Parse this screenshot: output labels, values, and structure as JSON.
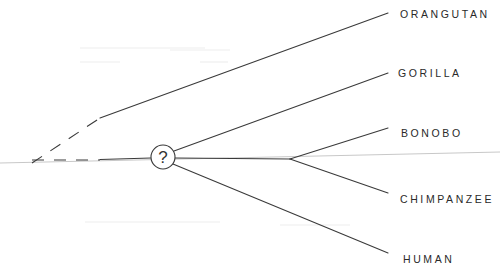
{
  "diagram": {
    "type": "phylogenetic-tree",
    "unknown_node_symbol": "?",
    "taxa": [
      {
        "id": "orangutan",
        "label": "ORANGUTAN"
      },
      {
        "id": "gorilla",
        "label": "GORILLA"
      },
      {
        "id": "bonobo",
        "label": "BONOBO"
      },
      {
        "id": "chimpanzee",
        "label": "CHIMPANZEE"
      },
      {
        "id": "human",
        "label": "HUMAN"
      }
    ],
    "relationships": [
      {
        "from": "root",
        "to": "orangutan",
        "uncertain_base": true
      },
      {
        "from": "root",
        "to": "unknown-ancestor",
        "uncertain_base": true
      },
      {
        "from": "unknown-ancestor",
        "to": "gorilla"
      },
      {
        "from": "unknown-ancestor",
        "to": "human"
      },
      {
        "from": "unknown-ancestor",
        "to": "pan-ancestor"
      },
      {
        "from": "pan-ancestor",
        "to": "bonobo"
      },
      {
        "from": "pan-ancestor",
        "to": "chimpanzee"
      }
    ],
    "colors": {
      "line": "#3a3a3a",
      "text": "#2a2a2a",
      "guide": "#c8c8c8",
      "background": "#ffffff"
    }
  }
}
